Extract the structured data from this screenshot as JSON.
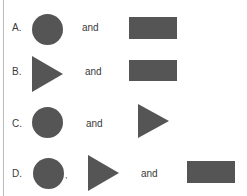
{
  "options": [
    {
      "letter": "A.",
      "connector": "and",
      "shapes": [
        "circle",
        "rectangle"
      ]
    },
    {
      "letter": "B.",
      "connector": "and",
      "shapes": [
        "triangle",
        "rectangle"
      ]
    },
    {
      "letter": "C.",
      "connector": "and",
      "shapes": [
        "circle",
        "triangle"
      ]
    },
    {
      "letter": "D.",
      "separator": ",",
      "connector": "and",
      "shapes": [
        "circle",
        "triangle",
        "rectangle"
      ]
    }
  ],
  "colors": {
    "shape_fill": "#555555",
    "border_line": "#bdbdbd"
  }
}
